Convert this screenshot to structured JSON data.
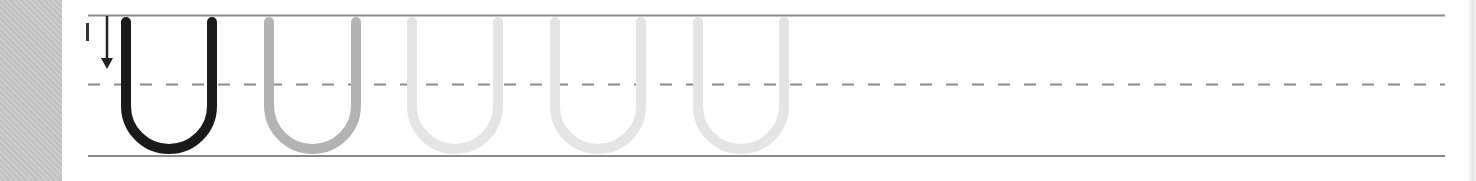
{
  "worksheet": {
    "letter": "U",
    "stroke_number": "1",
    "stroke_direction": "down",
    "guide_lines": {
      "top_y": 15,
      "midline_y": 84,
      "baseline_y": 156,
      "x_start": 88,
      "x_end": 1445,
      "line_color": "#8a8a8a",
      "dash_color": "#8a8a8a"
    },
    "letters": [
      {
        "index": 1,
        "role": "model",
        "color": "#1a1a1a",
        "left_x": 126,
        "right_x": 212
      },
      {
        "index": 2,
        "role": "trace-dark",
        "color": "#b3b3b3",
        "left_x": 269,
        "right_x": 356
      },
      {
        "index": 3,
        "role": "trace-light",
        "color": "#e4e4e4",
        "left_x": 412,
        "right_x": 498
      },
      {
        "index": 4,
        "role": "trace-light",
        "color": "#e4e4e4",
        "left_x": 555,
        "right_x": 641
      },
      {
        "index": 5,
        "role": "trace-light",
        "color": "#e4e4e4",
        "left_x": 698,
        "right_x": 784
      }
    ],
    "side_panel_color": "#c9c9c9"
  }
}
